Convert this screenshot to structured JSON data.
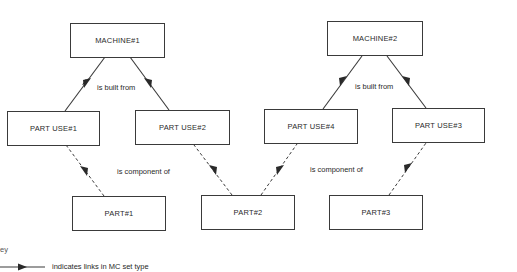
{
  "diagram": {
    "nodes": {
      "machine1": {
        "label": "MACHINE#1"
      },
      "machine2": {
        "label": "MACHINE#2"
      },
      "partuse1": {
        "label": "PART USE#1"
      },
      "partuse2": {
        "label": "PART USE#2"
      },
      "partuse4": {
        "label": "PART USE#4"
      },
      "partuse3": {
        "label": "PART USE#3"
      },
      "part1": {
        "label": "PART#1"
      },
      "part2": {
        "label": "PART#2"
      },
      "part3": {
        "label": "PART#3"
      }
    },
    "edge_labels": {
      "built_from_1": "is built from",
      "built_from_2": "is built from",
      "component_of_1": "is component of",
      "component_of_2": "is component of"
    },
    "edges": [
      {
        "from": "machine1",
        "to": "partuse1",
        "style": "solid",
        "relation": "is built from"
      },
      {
        "from": "machine1",
        "to": "partuse2",
        "style": "solid",
        "relation": "is built from"
      },
      {
        "from": "machine2",
        "to": "partuse4",
        "style": "solid",
        "relation": "is built from"
      },
      {
        "from": "machine2",
        "to": "partuse3",
        "style": "solid",
        "relation": "is built from"
      },
      {
        "from": "part1",
        "to": "partuse1",
        "style": "dashed",
        "relation": "is component of"
      },
      {
        "from": "part2",
        "to": "partuse2",
        "style": "dashed",
        "relation": "is component of"
      },
      {
        "from": "part2",
        "to": "partuse4",
        "style": "dashed",
        "relation": "is component of"
      },
      {
        "from": "part3",
        "to": "partuse3",
        "style": "dashed",
        "relation": "is component of"
      }
    ],
    "key": {
      "title": "Key",
      "title_visible": "ey",
      "items": [
        {
          "symbol": "solid-arrow",
          "text": "indicates links in MC set type"
        }
      ]
    },
    "colors": {
      "line": "#3a3a3a",
      "text": "#2a2a2a",
      "background": "#ffffff"
    }
  }
}
